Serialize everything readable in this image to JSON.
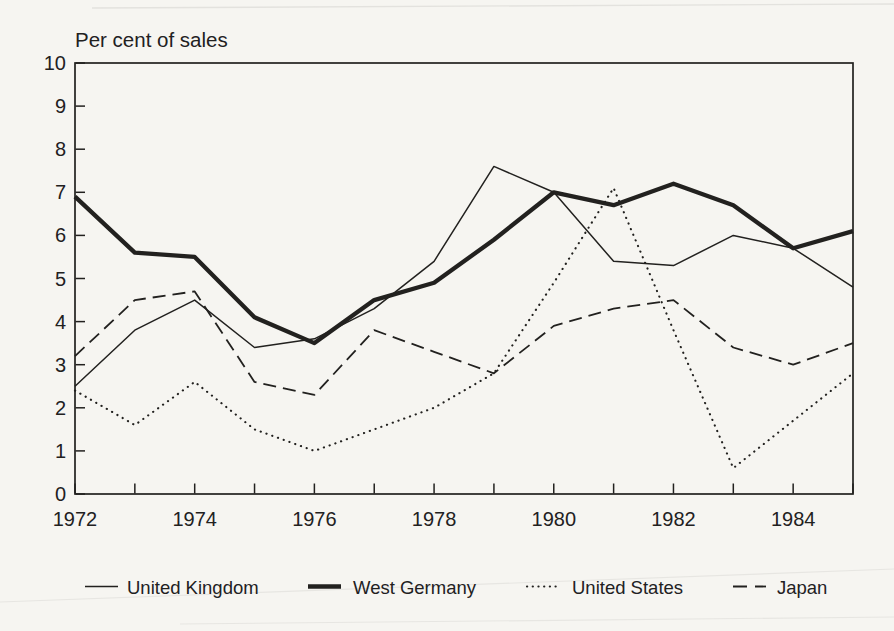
{
  "page": {
    "background": "#f6f5f1",
    "ink": "#22211f"
  },
  "chart_data": {
    "type": "line",
    "title": "Per cent of sales",
    "x": [
      1972,
      1973,
      1974,
      1975,
      1976,
      1977,
      1978,
      1979,
      1980,
      1981,
      1982,
      1983,
      1984,
      1985
    ],
    "xlim": [
      1972,
      1985
    ],
    "ylim": [
      0,
      10
    ],
    "y_ticks": [
      0,
      1,
      2,
      3,
      4,
      5,
      6,
      7,
      8,
      9,
      10
    ],
    "x_tick_labels": [
      "1972",
      "1974",
      "1976",
      "1978",
      "1980",
      "1982",
      "1984"
    ],
    "grid": false,
    "legend_position": "bottom",
    "series": [
      {
        "name": "United Kingdom",
        "line_style": "solid-thin",
        "values": [
          2.5,
          3.8,
          4.5,
          3.4,
          3.6,
          4.3,
          5.4,
          7.6,
          7.0,
          5.4,
          5.3,
          6.0,
          5.7,
          4.8
        ]
      },
      {
        "name": "West Germany",
        "line_style": "solid-thick",
        "values": [
          6.9,
          5.6,
          5.5,
          4.1,
          3.5,
          4.5,
          4.9,
          5.9,
          7.0,
          6.7,
          7.2,
          6.7,
          5.7,
          6.1
        ]
      },
      {
        "name": "United States",
        "line_style": "dotted",
        "values": [
          2.4,
          1.6,
          2.6,
          1.5,
          1.0,
          1.5,
          2.0,
          2.8,
          4.9,
          7.1,
          3.8,
          0.6,
          1.7,
          2.8
        ]
      },
      {
        "name": "Japan",
        "line_style": "dashed",
        "values": [
          3.2,
          4.5,
          4.7,
          2.6,
          2.3,
          3.8,
          3.3,
          2.8,
          3.9,
          4.3,
          4.5,
          3.4,
          3.0,
          3.5
        ]
      }
    ]
  }
}
